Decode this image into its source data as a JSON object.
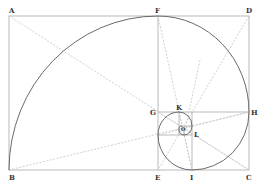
{
  "diagram": {
    "colors": {
      "frame": "#a8a8a8",
      "dashed": "#c4c4c4",
      "spiral": "#6a6a6a",
      "labels": "#333333"
    },
    "points": {
      "A": {
        "label": "A",
        "x": 9,
        "y": 16
      },
      "F": {
        "label": "F",
        "x": 158,
        "y": 16
      },
      "D": {
        "label": "D",
        "x": 249,
        "y": 16
      },
      "B": {
        "label": "B",
        "x": 9,
        "y": 170
      },
      "E": {
        "label": "E",
        "x": 158,
        "y": 170
      },
      "I": {
        "label": "I",
        "x": 192,
        "y": 170
      },
      "C": {
        "label": "C",
        "x": 249,
        "y": 170
      },
      "G": {
        "label": "G",
        "x": 158,
        "y": 112
      },
      "H": {
        "label": "H",
        "x": 249,
        "y": 112
      },
      "K": {
        "label": "K",
        "x": 179,
        "y": 112
      },
      "L": {
        "label": "L",
        "x": 192,
        "y": 133
      },
      "O": {
        "label": "O",
        "x": 183,
        "y": 128
      }
    }
  }
}
